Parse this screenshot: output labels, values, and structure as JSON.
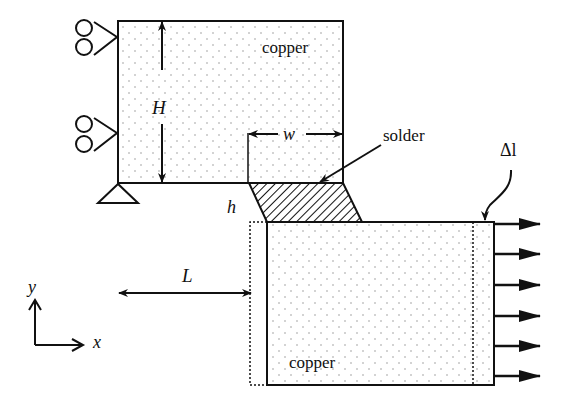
{
  "diagram": {
    "type": "mechanics-schematic",
    "top_block": {
      "label": "copper"
    },
    "bottom_block": {
      "label": "copper"
    },
    "solder": {
      "label": "solder"
    },
    "dimensions": {
      "H": "H",
      "w": "w",
      "h": "h",
      "L": "L",
      "delta_l": "Δl"
    },
    "axes": {
      "x": "x",
      "y": "y"
    },
    "supports": [
      {
        "type": "roller",
        "position": "left-top"
      },
      {
        "type": "roller",
        "position": "left-middle"
      },
      {
        "type": "pin",
        "position": "bottom-left-corner"
      }
    ],
    "load": {
      "type": "distributed-tension",
      "arrow_count": 6,
      "direction": "+x"
    },
    "colors": {
      "line": "#111111",
      "fill_dots": "#9a9a9a",
      "background": "#ffffff"
    }
  }
}
